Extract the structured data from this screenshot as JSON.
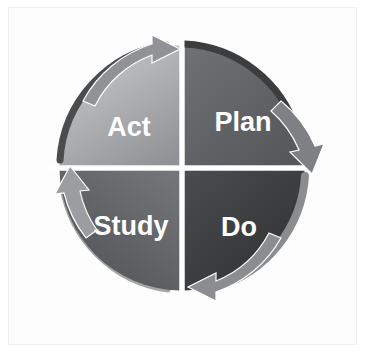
{
  "diagram": {
    "direction": "clockwise",
    "quadrants": [
      {
        "id": "plan",
        "label": "Plan",
        "position": "top-right",
        "fill_light": "#6f7173",
        "fill_dark": "#55585b",
        "rim_color": "#3b3d3f",
        "label_x": 243,
        "label_y": 124
      },
      {
        "id": "do",
        "label": "Do",
        "position": "bottom-right",
        "fill_light": "#4a4c4e",
        "fill_dark": "#2e3032",
        "rim_color": "#8a8c8e",
        "label_x": 239,
        "label_y": 229
      },
      {
        "id": "study",
        "label": "Study",
        "position": "bottom-left",
        "fill_light": "#737578",
        "fill_dark": "#4f5154",
        "rim_color": "#5b5d60",
        "label_x": 131,
        "label_y": 228
      },
      {
        "id": "act",
        "label": "Act",
        "position": "top-left",
        "fill_light": "#c6c8ca",
        "fill_dark": "#8f9194",
        "rim_color": "#4a4c4e",
        "label_x": 129,
        "label_y": 129
      }
    ],
    "arrows": [
      {
        "id": "act-to-plan",
        "position": "top",
        "points_toward": "right",
        "color": "#909295"
      },
      {
        "id": "plan-to-do",
        "position": "right",
        "points_toward": "down",
        "color": "#7e8083"
      },
      {
        "id": "do-to-study",
        "position": "bottom",
        "points_toward": "left",
        "color": "#8b8d90"
      },
      {
        "id": "study-to-act",
        "position": "left",
        "points_toward": "up",
        "color": "#9b9da0"
      }
    ],
    "geometry": {
      "center_x": 182,
      "center_y": 168,
      "radius": 125,
      "divider_color": "#ffffff",
      "divider_width": 5
    },
    "background_color": "#ffffff",
    "panel_color": "#fdfdfd",
    "panel_border_color": "#f0f0f0"
  }
}
